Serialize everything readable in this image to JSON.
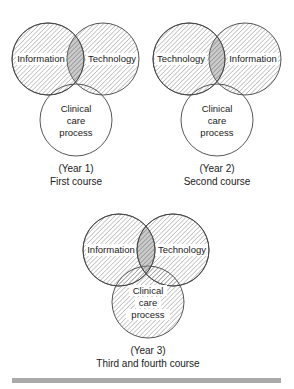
{
  "panels": [
    {
      "id": "year1",
      "circles": [
        {
          "label": [
            "Information"
          ],
          "cx": 48,
          "cy": 59,
          "r": 36,
          "hatched": true
        },
        {
          "label": [
            "Technology"
          ],
          "cx": 103,
          "cy": 59,
          "r": 36,
          "hatched": true
        },
        {
          "label": [
            "Clinical",
            "care",
            "process"
          ],
          "cx": 76,
          "cy": 120,
          "r": 36,
          "hatched": false
        }
      ],
      "caption": {
        "year": "(Year 1)",
        "course": "First course"
      }
    },
    {
      "id": "year2",
      "circles": [
        {
          "label": [
            "Technology"
          ],
          "cx": 189,
          "cy": 59,
          "r": 36,
          "hatched": true
        },
        {
          "label": [
            "Information"
          ],
          "cx": 245,
          "cy": 59,
          "r": 36,
          "hatched": true
        },
        {
          "label": [
            "Clinical",
            "care",
            "process"
          ],
          "cx": 217,
          "cy": 120,
          "r": 36,
          "hatched": false
        }
      ],
      "caption": {
        "year": "(Year 2)",
        "course": "Second course"
      }
    },
    {
      "id": "year3",
      "circles": [
        {
          "label": [
            "Information"
          ],
          "cx": 119,
          "cy": 250,
          "r": 36,
          "hatched": true
        },
        {
          "label": [
            "Technology"
          ],
          "cx": 173,
          "cy": 250,
          "r": 36,
          "hatched": true
        },
        {
          "label": [
            "Clinical",
            "care",
            "process"
          ],
          "cx": 148,
          "cy": 302,
          "r": 36,
          "hatched": true
        }
      ],
      "caption": {
        "year": "(Year 3)",
        "course": "Third and fourth course"
      }
    }
  ],
  "colors": {
    "stroke": "#444444",
    "hatch": "#8a8a8a",
    "overlap": "#9a9a9a",
    "bar": "#aaaaaa"
  }
}
